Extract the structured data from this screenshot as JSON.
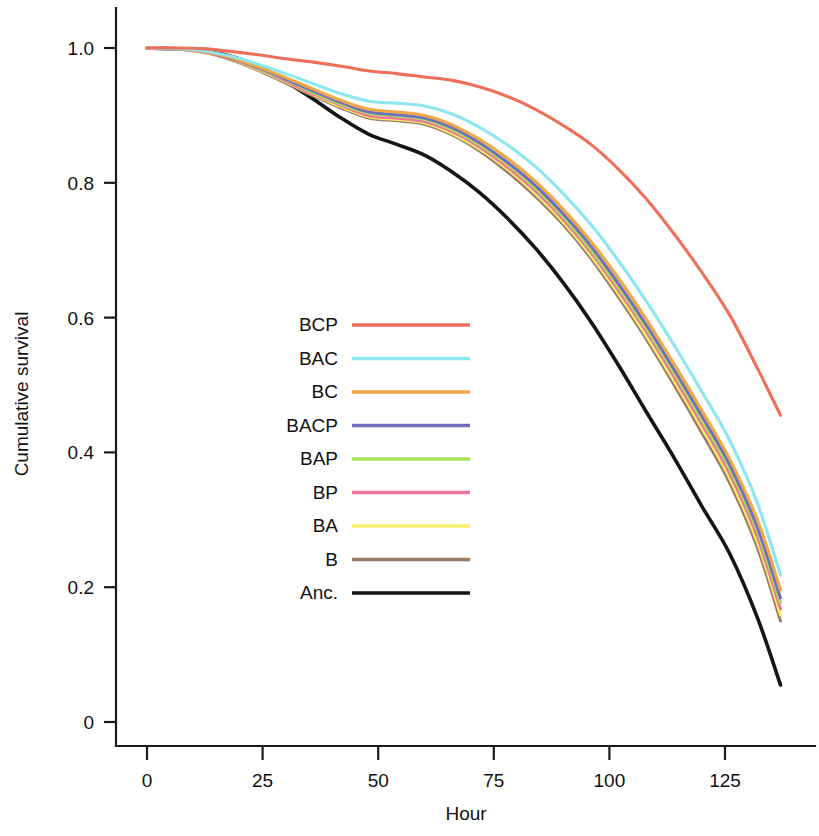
{
  "chart_data": {
    "type": "line",
    "title": "",
    "subtitle": "",
    "xlabel": "Hour",
    "ylabel": "Cumulative survival",
    "xlim": [
      -4,
      140
    ],
    "ylim": [
      0,
      1.04
    ],
    "xticks": [
      0,
      25,
      50,
      75,
      100,
      125
    ],
    "xticklabels": [
      "0",
      "25",
      "50",
      "75",
      "100",
      "125"
    ],
    "yticks": [
      0,
      0.2,
      0.4,
      0.6,
      0.8,
      1.0
    ],
    "yticklabels": [
      "0",
      "0.2",
      "0.4",
      "0.6",
      "0.8",
      "1.0"
    ],
    "grid": false,
    "legend_position": "center-left",
    "x": [
      0,
      6,
      12,
      18,
      24,
      30,
      36,
      42,
      48,
      54,
      60,
      66,
      72,
      78,
      84,
      90,
      96,
      102,
      108,
      114,
      120,
      126,
      132,
      137
    ],
    "series": [
      {
        "name": "BCP",
        "color": "#ef6f5b",
        "values": [
          1.0,
          1.0,
          0.999,
          0.995,
          0.99,
          0.984,
          0.979,
          0.973,
          0.966,
          0.962,
          0.957,
          0.952,
          0.942,
          0.928,
          0.909,
          0.885,
          0.857,
          0.82,
          0.776,
          0.724,
          0.667,
          0.604,
          0.525,
          0.455
        ]
      },
      {
        "name": "BAC",
        "color": "#8ce7f0",
        "values": [
          1.0,
          0.999,
          0.996,
          0.988,
          0.976,
          0.962,
          0.947,
          0.932,
          0.921,
          0.918,
          0.914,
          0.902,
          0.882,
          0.856,
          0.824,
          0.784,
          0.738,
          0.684,
          0.624,
          0.559,
          0.49,
          0.418,
          0.325,
          0.218
        ]
      },
      {
        "name": "BC",
        "color": "#f0a845",
        "values": [
          1.0,
          0.999,
          0.995,
          0.986,
          0.972,
          0.956,
          0.939,
          0.922,
          0.909,
          0.905,
          0.9,
          0.886,
          0.864,
          0.836,
          0.802,
          0.761,
          0.713,
          0.658,
          0.597,
          0.531,
          0.462,
          0.39,
          0.3,
          0.196
        ]
      },
      {
        "name": "BACP",
        "color": "#6d6fc0",
        "values": [
          1.0,
          0.999,
          0.995,
          0.985,
          0.971,
          0.954,
          0.936,
          0.919,
          0.905,
          0.901,
          0.896,
          0.882,
          0.859,
          0.83,
          0.796,
          0.754,
          0.706,
          0.65,
          0.589,
          0.523,
          0.454,
          0.382,
          0.289,
          0.184
        ]
      },
      {
        "name": "BAP",
        "color": "#a9e05a",
        "values": [
          1.0,
          0.999,
          0.995,
          0.985,
          0.97,
          0.953,
          0.934,
          0.917,
          0.903,
          0.899,
          0.894,
          0.879,
          0.856,
          0.827,
          0.792,
          0.75,
          0.701,
          0.645,
          0.584,
          0.518,
          0.448,
          0.376,
          0.283,
          0.177
        ]
      },
      {
        "name": "BP",
        "color": "#f472a0",
        "values": [
          1.0,
          0.999,
          0.994,
          0.984,
          0.969,
          0.951,
          0.932,
          0.915,
          0.9,
          0.896,
          0.891,
          0.876,
          0.853,
          0.823,
          0.788,
          0.746,
          0.697,
          0.64,
          0.579,
          0.512,
          0.442,
          0.369,
          0.275,
          0.168
        ]
      },
      {
        "name": "BA",
        "color": "#f6f06a",
        "values": [
          1.0,
          0.999,
          0.994,
          0.984,
          0.968,
          0.95,
          0.931,
          0.913,
          0.898,
          0.894,
          0.889,
          0.873,
          0.85,
          0.82,
          0.784,
          0.742,
          0.692,
          0.635,
          0.573,
          0.506,
          0.436,
          0.362,
          0.267,
          0.159
        ]
      },
      {
        "name": "B",
        "color": "#9a7b62",
        "values": [
          1.0,
          0.999,
          0.994,
          0.983,
          0.967,
          0.948,
          0.929,
          0.911,
          0.896,
          0.892,
          0.887,
          0.871,
          0.847,
          0.816,
          0.78,
          0.738,
          0.688,
          0.63,
          0.568,
          0.5,
          0.429,
          0.355,
          0.259,
          0.15
        ]
      },
      {
        "name": "Anc.",
        "color": "#151515",
        "values": [
          1.0,
          0.999,
          0.996,
          0.988,
          0.973,
          0.95,
          0.924,
          0.896,
          0.872,
          0.857,
          0.841,
          0.816,
          0.785,
          0.747,
          0.703,
          0.652,
          0.594,
          0.529,
          0.46,
          0.392,
          0.32,
          0.25,
          0.155,
          0.055
        ]
      }
    ]
  },
  "legend": {
    "entries": [
      {
        "label": "BCP",
        "color": "#ef6f5b"
      },
      {
        "label": "BAC",
        "color": "#8ce7f0"
      },
      {
        "label": "BC",
        "color": "#f0a845"
      },
      {
        "label": "BACP",
        "color": "#6d6fc0"
      },
      {
        "label": "BAP",
        "color": "#a9e05a"
      },
      {
        "label": "BP",
        "color": "#f472a0"
      },
      {
        "label": "BA",
        "color": "#f6f06a"
      },
      {
        "label": "B",
        "color": "#9a7b62"
      },
      {
        "label": "Anc.",
        "color": "#151515"
      }
    ]
  },
  "axes": {
    "x_title": "Hour",
    "y_title": "Cumulative survival",
    "axis_color": "#1a1a1a"
  }
}
